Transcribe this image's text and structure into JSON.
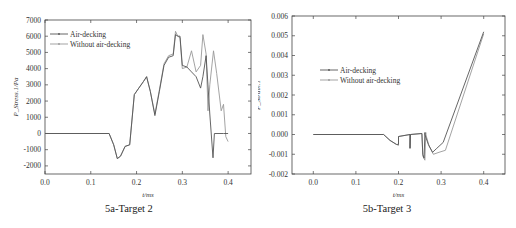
{
  "figures": [
    {
      "caption": "5a-Target 2",
      "xlabel": "t/ms",
      "ylabel": "P_Stress.1/Pa",
      "legend": [
        "Air-decking",
        "Without air-decking"
      ]
    },
    {
      "caption": "5b-Target 3",
      "xlabel": "t/ms",
      "ylabel": "P_Strain.1",
      "legend": [
        "Air-decking",
        "Without air-decking"
      ]
    }
  ],
  "chart_data": [
    {
      "type": "line",
      "title": "5a-Target 2",
      "xlabel": "t/ms",
      "ylabel": "P_Stress.1/Pa",
      "xlim": [
        0.0,
        0.45
      ],
      "ylim": [
        -2500,
        7000
      ],
      "xticks": [
        "0.0",
        "0.1",
        "0.2",
        "0.3",
        "0.4"
      ],
      "yticks": [
        "-2000",
        "-1000",
        "0",
        "1000",
        "2000",
        "3000",
        "4000",
        "5000",
        "6000",
        "7000"
      ],
      "legend_position": "upper left",
      "grid": false,
      "series": [
        {
          "name": "Air-decking",
          "color": "#555555",
          "x": [
            0.0,
            0.14,
            0.15,
            0.158,
            0.165,
            0.175,
            0.185,
            0.195,
            0.205,
            0.215,
            0.222,
            0.23,
            0.24,
            0.25,
            0.26,
            0.27,
            0.28,
            0.285,
            0.29,
            0.295,
            0.3,
            0.31,
            0.32,
            0.33,
            0.34,
            0.345,
            0.352,
            0.36,
            0.367,
            0.37,
            0.38,
            0.39,
            0.4
          ],
          "values": [
            0,
            0,
            -700,
            -1550,
            -1400,
            -800,
            -700,
            2400,
            2800,
            3200,
            3500,
            2600,
            1100,
            2600,
            4200,
            4700,
            4800,
            6100,
            6000,
            6000,
            4200,
            4100,
            3800,
            3500,
            2800,
            3500,
            4800,
            1200,
            -1500,
            0,
            0,
            0,
            0
          ]
        },
        {
          "name": "Without air-decking",
          "color": "#999999",
          "x": [
            0.0,
            0.14,
            0.15,
            0.158,
            0.165,
            0.175,
            0.185,
            0.195,
            0.205,
            0.215,
            0.222,
            0.23,
            0.24,
            0.25,
            0.26,
            0.27,
            0.28,
            0.285,
            0.29,
            0.295,
            0.3,
            0.31,
            0.32,
            0.33,
            0.34,
            0.345,
            0.352,
            0.356,
            0.36,
            0.368,
            0.375,
            0.385,
            0.39,
            0.395,
            0.4
          ],
          "values": [
            0,
            0,
            -700,
            -1550,
            -1400,
            -800,
            -700,
            2400,
            2800,
            3200,
            3500,
            2600,
            1200,
            2700,
            4300,
            4800,
            4900,
            6300,
            6000,
            5900,
            4000,
            4100,
            5100,
            3800,
            4200,
            6100,
            4900,
            1400,
            3000,
            5100,
            3700,
            1400,
            1800,
            -200,
            -500
          ]
        }
      ]
    },
    {
      "type": "line",
      "title": "5b-Target 3",
      "xlabel": "t/ms",
      "ylabel": "P_Strain.1",
      "xlim": [
        -0.05,
        0.45
      ],
      "ylim": [
        -0.002,
        0.006
      ],
      "xticks": [
        "0.0",
        "0.1",
        "0.2",
        "0.3",
        "0.4"
      ],
      "yticks": [
        "-0.002",
        "-0.001",
        "0.000",
        "0.001",
        "0.002",
        "0.003",
        "0.004",
        "0.005",
        "0.006"
      ],
      "legend_position": "center left",
      "grid": false,
      "series": [
        {
          "name": "Air-decking",
          "color": "#555555",
          "x": [
            0.0,
            0.165,
            0.18,
            0.195,
            0.2,
            0.2,
            0.227,
            0.227,
            0.228,
            0.255,
            0.257,
            0.26,
            0.262,
            0.262,
            0.27,
            0.28,
            0.29,
            0.305,
            0.4
          ],
          "values": [
            0,
            0,
            -0.0003,
            -0.0005,
            -0.0005,
            -0.0001,
            0,
            -0.0007,
            0,
            5e-05,
            -0.001,
            -0.0012,
            0.0001,
            0,
            -0.0005,
            -0.0009,
            -0.0007,
            -0.0004,
            0.0052
          ]
        },
        {
          "name": "Without air-decking",
          "color": "#999999",
          "x": [
            0.0,
            0.165,
            0.18,
            0.195,
            0.2,
            0.2,
            0.227,
            0.227,
            0.228,
            0.255,
            0.257,
            0.262,
            0.264,
            0.264,
            0.272,
            0.282,
            0.295,
            0.31,
            0.4
          ],
          "values": [
            0,
            0,
            -0.0003,
            -0.0005,
            -0.00055,
            -0.0001,
            0,
            -0.0007,
            0,
            5e-05,
            -0.0011,
            -0.0013,
            0.0001,
            0,
            -0.0006,
            -0.001,
            -0.0009,
            -0.0008,
            0.0051
          ]
        }
      ]
    }
  ]
}
